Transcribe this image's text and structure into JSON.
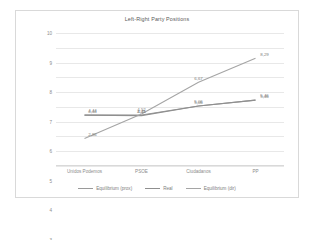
{
  "chart_data": {
    "type": "line",
    "title": "Left-Right Party Positions",
    "xlabel": "",
    "ylabel": "",
    "categories": [
      "Unidos Podemos",
      "PSOE",
      "Ciudadanos",
      "PP"
    ],
    "ylim": [
      1,
      10
    ],
    "yticks": [
      10,
      9,
      8,
      7,
      6,
      5,
      4,
      3,
      2,
      1
    ],
    "grid": true,
    "legend_position": "bottom",
    "series": [
      {
        "name": "Equilibrium (prox)",
        "color": "#9a9a9a",
        "values": [
          4.44,
          4.45,
          5.06,
          5.46
        ],
        "labels": [
          "4,44",
          "4,45",
          "5,06",
          "5,46"
        ]
      },
      {
        "name": "Real",
        "color": "#8f8f8f",
        "values": [
          4.44,
          4.41,
          5.06,
          5.46
        ],
        "labels": [
          "4,44",
          "4,41",
          "5,06",
          "5,46"
        ]
      },
      {
        "name": "Equilibrium (dir)",
        "color": "#a5a5a5",
        "values": [
          2.86,
          4.52,
          6.67,
          8.29
        ],
        "labels": [
          "2,86",
          "4,52",
          "6,67",
          "8,29"
        ]
      }
    ]
  },
  "colors": {
    "frame_border": "#d9d9d9",
    "gridline": "#e8e8e8",
    "tick_text": "#8c8c8c",
    "title_text": "#595959",
    "label_text": "#808080"
  }
}
